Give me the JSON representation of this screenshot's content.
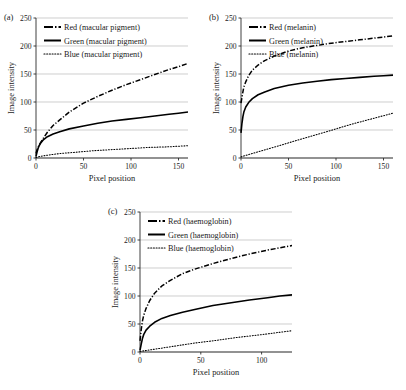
{
  "figure": {
    "panel_labels": [
      "(a)",
      "(b)",
      "(c)"
    ]
  },
  "chart_data": [
    {
      "type": "line",
      "panel": "(a)",
      "title": "",
      "xlabel": "Pixel position",
      "ylabel": "Image intensity",
      "xlim": [
        0,
        160
      ],
      "ylim": [
        0,
        250
      ],
      "xticks": [
        0,
        50,
        100,
        150
      ],
      "yticks": [
        0,
        50,
        100,
        150,
        200,
        250
      ],
      "grid": true,
      "legend_position": "top-left",
      "series": [
        {
          "name": "Red (macular pigment)",
          "style": "dash-dot",
          "color": "#000000",
          "x": [
            0,
            1,
            2,
            3,
            5,
            8,
            12,
            18,
            25,
            35,
            50,
            65,
            80,
            95,
            110,
            125,
            140,
            150,
            160
          ],
          "values": [
            8,
            14,
            18,
            22,
            28,
            36,
            46,
            58,
            68,
            82,
            98,
            110,
            121,
            131,
            140,
            149,
            158,
            163,
            169
          ]
        },
        {
          "name": "Green (macular pigment)",
          "style": "solid",
          "color": "#000000",
          "x": [
            0,
            1,
            2,
            3,
            5,
            8,
            12,
            18,
            25,
            35,
            50,
            65,
            80,
            95,
            110,
            125,
            140,
            150,
            160
          ],
          "values": [
            3,
            10,
            16,
            21,
            27,
            33,
            38,
            43,
            47,
            52,
            57,
            62,
            66,
            69,
            72,
            75,
            78,
            80,
            82
          ]
        },
        {
          "name": "Blue (macular pigment)",
          "style": "dotted",
          "color": "#000000",
          "x": [
            0,
            5,
            12,
            25,
            40,
            60,
            80,
            100,
            120,
            140,
            160
          ],
          "values": [
            1,
            3,
            5,
            8,
            10,
            13,
            15,
            17,
            19,
            20,
            22
          ]
        }
      ]
    },
    {
      "type": "line",
      "panel": "(b)",
      "title": "",
      "xlabel": "Pixel position",
      "ylabel": "Image intensity",
      "xlim": [
        0,
        160
      ],
      "ylim": [
        0,
        250
      ],
      "xticks": [
        0,
        50,
        100,
        150
      ],
      "yticks": [
        0,
        50,
        100,
        150,
        200,
        250
      ],
      "grid": true,
      "legend_position": "top-left",
      "series": [
        {
          "name": "Red (melanin)",
          "style": "dash-dot",
          "color": "#000000",
          "x": [
            0,
            1,
            2,
            3,
            5,
            8,
            12,
            18,
            25,
            35,
            50,
            65,
            80,
            95,
            110,
            125,
            140,
            150,
            160
          ],
          "values": [
            98,
            108,
            118,
            127,
            136,
            147,
            157,
            166,
            174,
            182,
            191,
            197,
            201,
            205,
            208,
            211,
            214,
            216,
            218
          ]
        },
        {
          "name": "Green (melanin)",
          "style": "solid",
          "color": "#000000",
          "x": [
            0,
            1,
            2,
            3,
            5,
            8,
            12,
            18,
            25,
            35,
            50,
            65,
            80,
            95,
            110,
            125,
            140,
            150,
            160
          ],
          "values": [
            45,
            62,
            74,
            82,
            91,
            99,
            106,
            113,
            118,
            124,
            130,
            134,
            137,
            140,
            142,
            144,
            146,
            147,
            148
          ]
        },
        {
          "name": "Blue (melanin)",
          "style": "dotted",
          "color": "#000000",
          "x": [
            0,
            20,
            40,
            60,
            80,
            100,
            120,
            140,
            160
          ],
          "values": [
            2,
            12,
            22,
            32,
            42,
            52,
            62,
            71,
            80
          ]
        }
      ]
    },
    {
      "type": "line",
      "panel": "(c)",
      "title": "",
      "xlabel": "Pixel position",
      "ylabel": "Image intensity",
      "xlim": [
        0,
        125
      ],
      "ylim": [
        0,
        250
      ],
      "xticks": [
        0,
        50,
        100
      ],
      "yticks": [
        0,
        50,
        100,
        150,
        200,
        250
      ],
      "grid": true,
      "legend_position": "top-left",
      "series": [
        {
          "name": "Red (haemoglobin)",
          "style": "dash-dot",
          "color": "#000000",
          "x": [
            0,
            1,
            2,
            3,
            5,
            8,
            12,
            18,
            25,
            35,
            45,
            60,
            75,
            90,
            105,
            115,
            125
          ],
          "values": [
            20,
            40,
            55,
            65,
            78,
            92,
            105,
            118,
            128,
            140,
            148,
            158,
            167,
            175,
            182,
            186,
            190
          ]
        },
        {
          "name": "Green (haemoglobin)",
          "style": "solid",
          "color": "#000000",
          "x": [
            0,
            1,
            2,
            3,
            5,
            8,
            12,
            18,
            25,
            35,
            45,
            60,
            75,
            90,
            105,
            115,
            125
          ],
          "values": [
            3,
            14,
            24,
            31,
            39,
            46,
            53,
            60,
            65,
            71,
            76,
            83,
            88,
            93,
            97,
            100,
            102
          ]
        },
        {
          "name": "Blue (haemoglobin)",
          "style": "dotted",
          "color": "#000000",
          "x": [
            0,
            15,
            30,
            45,
            60,
            80,
            100,
            125
          ],
          "values": [
            1,
            6,
            11,
            16,
            20,
            26,
            31,
            38
          ]
        }
      ]
    }
  ]
}
